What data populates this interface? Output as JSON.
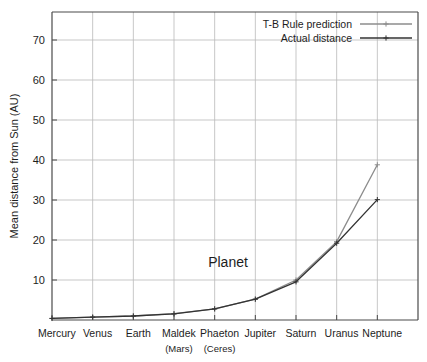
{
  "chart_data": {
    "type": "line",
    "title": "",
    "inner_label": "Planet",
    "xlabel": "Planet",
    "ylabel": "Mean distance from Sun (AU)",
    "ylim": [
      0,
      77
    ],
    "yticks": [
      10,
      20,
      30,
      40,
      50,
      60,
      70
    ],
    "ytick_labels": [
      "10",
      "20",
      "30",
      "40",
      "50",
      "60",
      "70"
    ],
    "grid": true,
    "legend_position": "top-right",
    "categories": [
      "Mercury",
      "Venus",
      "Earth",
      "Maldek",
      "Phaeton",
      "Jupiter",
      "Saturn",
      "Uranus",
      "Neptune"
    ],
    "category_subs": [
      "",
      "",
      "",
      "(Mars)",
      "(Ceres)",
      "",
      "",
      "",
      ""
    ],
    "series": [
      {
        "name": "T-B Rule prediction",
        "color": "#8c8c8c",
        "marker": "plus",
        "values": [
          0.4,
          0.7,
          1.0,
          1.6,
          2.8,
          5.2,
          10.0,
          19.6,
          38.8
        ]
      },
      {
        "name": "Actual distance",
        "color": "#333333",
        "marker": "plus",
        "values": [
          0.39,
          0.72,
          1.0,
          1.52,
          2.77,
          5.2,
          9.54,
          19.2,
          30.1
        ]
      }
    ]
  },
  "legend": {
    "items": [
      {
        "label": "T-B Rule prediction"
      },
      {
        "label": "Actual distance"
      }
    ]
  },
  "colors": {
    "prediction": "#8c8c8c",
    "actual": "#333333",
    "grid": "#b9b9b9",
    "axis": "#4a4a4a",
    "background": "#ffffff"
  }
}
